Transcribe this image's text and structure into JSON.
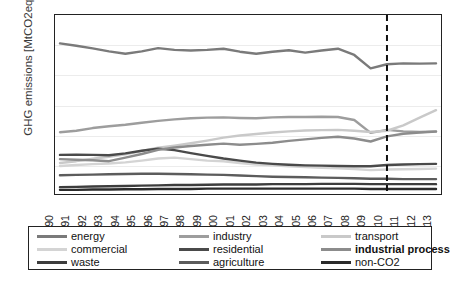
{
  "chart_data": {
    "type": "line",
    "title": "",
    "xlabel": "",
    "ylabel": "GHG emissions [MtCO2eq]",
    "ylim": [
      0,
      600
    ],
    "yticks": [
      0,
      100,
      200,
      300,
      400,
      500,
      600
    ],
    "grid": true,
    "legend_position": "bottom",
    "x": [
      1990,
      1991,
      1992,
      1993,
      1994,
      1995,
      1996,
      1997,
      1998,
      1999,
      2000,
      2001,
      2002,
      2003,
      2004,
      2005,
      2006,
      2007,
      2008,
      2009,
      2010,
      2011,
      2012,
      2013
    ],
    "categories": [
      "1990",
      "1991",
      "1992",
      "1993",
      "1994",
      "1995",
      "1996",
      "1997",
      "1998",
      "1999",
      "2000",
      "2001",
      "2002",
      "2003",
      "2004",
      "2005",
      "2006",
      "2007",
      "2008",
      "2009",
      "2010",
      "2011",
      "2012",
      "2013"
    ],
    "annotations": [
      {
        "type": "vertical-dashed-line",
        "x": 2010,
        "label": ""
      }
    ],
    "series": [
      {
        "name": "energy",
        "color": "#7a7a7a",
        "values": [
          505,
          497,
          488,
          478,
          470,
          478,
          489,
          483,
          481,
          483,
          487,
          477,
          470,
          477,
          482,
          474,
          481,
          487,
          466,
          421,
          435,
          438,
          437,
          438
        ]
      },
      {
        "name": "industry",
        "color": "#9d9d9d",
        "values": [
          207,
          212,
          221,
          227,
          232,
          239,
          245,
          250,
          254,
          256,
          257,
          255,
          254,
          257,
          258,
          258,
          259,
          258,
          248,
          205,
          215,
          210,
          208,
          210
        ]
      },
      {
        "name": "transport",
        "color": "#c9c9c9",
        "values": [
          104,
          110,
          118,
          125,
          133,
          144,
          155,
          162,
          170,
          179,
          189,
          196,
          201,
          206,
          210,
          213,
          214,
          215,
          212,
          208,
          212,
          230,
          256,
          281
        ]
      },
      {
        "name": "commercial",
        "color": "#d4d4d4",
        "values": [
          94,
          97,
          100,
          102,
          106,
          112,
          119,
          122,
          117,
          112,
          110,
          104,
          99,
          96,
          93,
          90,
          88,
          86,
          84,
          80,
          82,
          83,
          84,
          85
        ]
      },
      {
        "name": "residential",
        "color": "#4a4a4a",
        "values": [
          131,
          132,
          131,
          130,
          136,
          145,
          152,
          147,
          137,
          128,
          119,
          112,
          105,
          101,
          98,
          96,
          95,
          94,
          93,
          93,
          97,
          99,
          100,
          101
        ]
      },
      {
        "name": "industrial process",
        "color": "#8c8c8c",
        "values": [
          117,
          115,
          113,
          110,
          122,
          134,
          148,
          156,
          161,
          165,
          169,
          165,
          168,
          172,
          178,
          183,
          188,
          192,
          186,
          176,
          193,
          202,
          206,
          209
        ]
      },
      {
        "name": "waste",
        "color": "#3d3d3d",
        "values": [
          23,
          24,
          25,
          26,
          27,
          28,
          29,
          30,
          30,
          31,
          32,
          32,
          32,
          33,
          33,
          33,
          34,
          34,
          34,
          33,
          33,
          33,
          33,
          33
        ]
      },
      {
        "name": "agriculture",
        "color": "#5c5c5c",
        "values": [
          63,
          64,
          65,
          66,
          67,
          68,
          68,
          67,
          66,
          65,
          64,
          62,
          60,
          58,
          57,
          56,
          55,
          54,
          53,
          51,
          51,
          50,
          50,
          50
        ]
      },
      {
        "name": "non-CO2",
        "color": "#2b2b2b",
        "values": [
          14,
          14,
          15,
          15,
          16,
          16,
          17,
          17,
          17,
          18,
          18,
          18,
          18,
          18,
          18,
          18,
          18,
          18,
          18,
          17,
          17,
          17,
          17,
          17
        ]
      }
    ]
  },
  "axis": {
    "ylabel": "GHG emissions [MtCO2eq]"
  },
  "legend": {
    "items": [
      {
        "label": "energy",
        "color": "#7a7a7a",
        "weight": "normal"
      },
      {
        "label": "industry",
        "color": "#9d9d9d",
        "weight": "normal"
      },
      {
        "label": "transport",
        "color": "#c9c9c9",
        "weight": "normal"
      },
      {
        "label": "commercial",
        "color": "#d4d4d4",
        "weight": "normal"
      },
      {
        "label": "residential",
        "color": "#4a4a4a",
        "weight": "normal"
      },
      {
        "label": "industrial process",
        "color": "#8c8c8c",
        "weight": "bold"
      },
      {
        "label": "waste",
        "color": "#3d3d3d",
        "weight": "normal"
      },
      {
        "label": "agriculture",
        "color": "#5c5c5c",
        "weight": "normal"
      },
      {
        "label": "non-CO2",
        "color": "#2b2b2b",
        "weight": "normal"
      }
    ]
  },
  "caption": {
    "text": ""
  }
}
